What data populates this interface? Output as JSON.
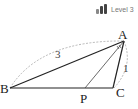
{
  "badge": {
    "label": "Level 3",
    "bars": 3
  },
  "diagram": {
    "points": {
      "A": {
        "label": "A"
      },
      "B": {
        "label": "B"
      },
      "C": {
        "label": "C"
      },
      "P": {
        "label": "P"
      }
    },
    "lengths": {
      "AB": "3",
      "AC": "1"
    },
    "colors": {
      "line": "#222222",
      "dashed": "#999999"
    }
  }
}
